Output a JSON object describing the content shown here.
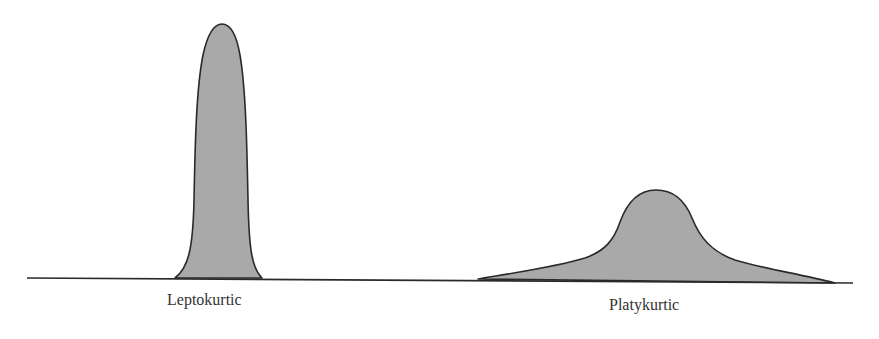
{
  "figure": {
    "title": "",
    "curves": [
      {
        "id": "leptokurtic",
        "label": "Leptokurtic",
        "shape": "tall narrow peak",
        "peak_x": 222,
        "peak_y": 24,
        "base_left_x": 175,
        "base_right_x": 262
      },
      {
        "id": "platykurtic",
        "label": "Platykurtic",
        "shape": "low broad peak with long tails",
        "peak_x": 656,
        "peak_y": 190,
        "base_left_x": 478,
        "base_right_x": 835
      }
    ],
    "baseline": {
      "x_start": 27,
      "x_end": 853,
      "y": 278
    },
    "colors": {
      "fill": "#a9a9a9",
      "stroke": "#2a2a2a",
      "text": "#333333",
      "background": "#ffffff"
    }
  }
}
